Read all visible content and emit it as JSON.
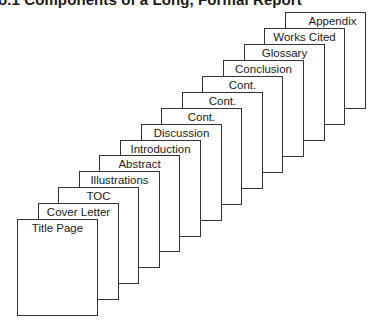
{
  "figure": {
    "title": "o.1 Components of a Long, Formal Report"
  },
  "pages": [
    {
      "label": "Title Page"
    },
    {
      "label": "Cover Letter"
    },
    {
      "label": "TOC"
    },
    {
      "label": "Illustrations"
    },
    {
      "label": "Abstract"
    },
    {
      "label": "Introduction"
    },
    {
      "label": "Discussion"
    },
    {
      "label": "Cont."
    },
    {
      "label": "Cont."
    },
    {
      "label": "Cont."
    },
    {
      "label": "Conclusion"
    },
    {
      "label": "Glossary"
    },
    {
      "label": "Works Cited"
    },
    {
      "label": "Appendix"
    }
  ],
  "colors": {
    "stroke": "#333333",
    "text": "#1a1a1a",
    "background": "#ffffff"
  }
}
